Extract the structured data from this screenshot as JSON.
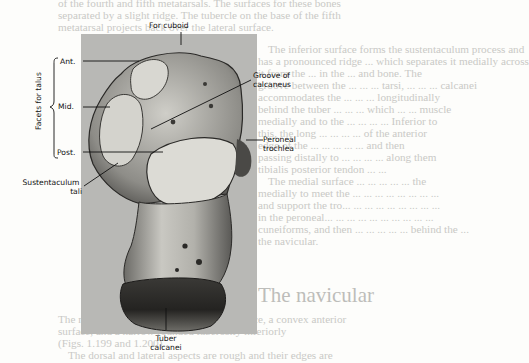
{
  "background_text": {
    "top_lines": [
      "of the fourth and fifth metatarsals. The surfaces for these bones",
      "separated by a slight ridge. The tubercle on the base of the fifth",
      "metatarsal projects back over the lateral surface."
    ],
    "right_column": [
      "The inferior surface forms the sustentaculum process and",
      "has a pronounced ridge ... which separates it medially across",
      "it from the ... in the ... and bone. The",
      "groove between the ... ... ... tarsi, ... ... ... calcanei",
      "accommodates the ... ... ... longitudinally",
      "behind the tuber ... ... ... which ... ... muscle",
      "medially and to the ... ... ... ... Inferior to",
      "this, the long ... ... ... ... of the anterior",
      "edge of the ... ... ... ... ... and then",
      "passing distally to ... ... ... ... along them",
      "tibialis posterior tendon ... ...",
      "The medial surface ... ... ... ... ... the",
      "medially to meet the ... ... ... ... ... ... ... ...",
      "and support the tro... ... ... ... ... ... ... ... ...",
      "in the peroneal... ... ... ... ... ... ... ... ... ...",
      "cuneiforms, and then ... ... ... ... ... behind the ...",
      "the navicular."
    ],
    "section_heading": "The navicular",
    "bottom_lines": [
      "The navicular has a concave proximal surface, a convex anterior",
      "surface, and a narrow rounded tuberosity inferiorly",
      "(Figs. 1.199 and 1.200).",
      "The dorsal and lateral aspects are rough and their edges are"
    ]
  },
  "figure": {
    "labels": {
      "for_cuboid": "For cuboid",
      "ant": "Ant.",
      "mid": "Mid.",
      "post": "Post.",
      "facets_for_talus": "Facets for talus",
      "groove_line1": "Groove of",
      "groove_line2": "calcaneus",
      "peroneal_line1": "Peroneal",
      "peroneal_line2": "trochlea",
      "sustentaculum_line1": "Sustentaculum",
      "sustentaculum_line2": "tali",
      "tuber_line1": "Tuber",
      "tuber_line2": "calcanei"
    },
    "colors": {
      "photo_background": "#b8b8b5",
      "bone_light": "#d9d8d2",
      "bone_mid": "#8d8c87",
      "bone_dark": "#2d2c2a",
      "leader_line": "#111111"
    }
  }
}
